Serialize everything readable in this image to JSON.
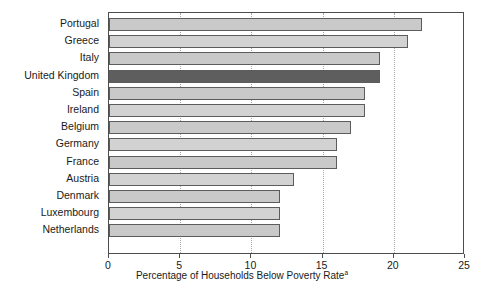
{
  "chart_data": {
    "type": "bar",
    "orientation": "horizontal",
    "title": "",
    "xlabel": "Percentage of Households Below Poverty Rate",
    "xlabel_superscript": "a",
    "ylabel": "",
    "categories": [
      "Portugal",
      "Greece",
      "Italy",
      "United Kingdom",
      "Spain",
      "Ireland",
      "Belgium",
      "Germany",
      "France",
      "Austria",
      "Denmark",
      "Luxembourg",
      "Netherlands"
    ],
    "values": [
      22,
      21,
      19,
      19,
      18,
      18,
      17,
      16,
      16,
      13,
      12,
      12,
      12
    ],
    "highlighted_category": "United Kingdom",
    "xlim": [
      0,
      25
    ],
    "xticks": [
      0,
      5,
      10,
      15,
      20,
      25
    ],
    "xtick_labels": [
      "0",
      "5",
      "10",
      "15",
      "20",
      "25"
    ],
    "gridlines": [
      5,
      10,
      15,
      20
    ],
    "grid": true,
    "legend": null,
    "colors": {
      "bar_light": "#c9c9c9",
      "bar_light_alt": "#d2d2d2",
      "bar_highlight": "#5e5e5e",
      "bar_border": "#5c5c5c",
      "axis": "#4d4d4d",
      "gridline": "#a8a8a8",
      "text": "#1a1a1a",
      "background": "#ffffff"
    }
  }
}
